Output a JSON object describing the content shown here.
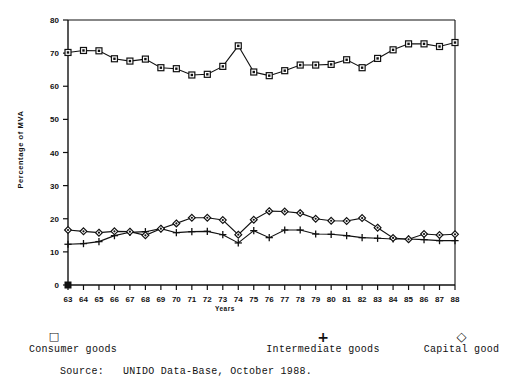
{
  "chart_data": {
    "type": "line",
    "title": "",
    "xlabel": "Years",
    "ylabel": "Percentage of MVA",
    "ylim": [
      0,
      80
    ],
    "yticks": [
      0,
      10,
      20,
      30,
      40,
      50,
      60,
      70,
      80
    ],
    "grid": false,
    "legend_position": "below-plot",
    "categories": [
      "63",
      "64",
      "65",
      "66",
      "67",
      "68",
      "69",
      "70",
      "71",
      "72",
      "73",
      "74",
      "75",
      "76",
      "77",
      "78",
      "79",
      "80",
      "81",
      "82",
      "83",
      "84",
      "85",
      "86",
      "87",
      "88"
    ],
    "series": [
      {
        "name": "Consumer goods",
        "marker": "square",
        "values": [
          70.2,
          70.8,
          70.7,
          68.3,
          67.6,
          68.2,
          65.6,
          65.3,
          63.4,
          63.6,
          66.0,
          72.2,
          64.3,
          63.2,
          64.7,
          66.4,
          66.4,
          66.6,
          68.0,
          65.6,
          68.4,
          71.0,
          72.8,
          72.8,
          72.0,
          73.2
        ]
      },
      {
        "name": "Intermediate goods",
        "marker": "plus",
        "values": [
          12.3,
          12.5,
          13.1,
          14.9,
          15.9,
          16.1,
          17.0,
          15.8,
          16.1,
          16.2,
          15.2,
          12.7,
          16.4,
          14.3,
          16.6,
          16.6,
          15.4,
          15.3,
          14.9,
          14.3,
          14.1,
          13.9,
          13.9,
          13.7,
          13.4,
          13.4
        ]
      },
      {
        "name": "Capital good",
        "marker": "diamond",
        "values": [
          16.6,
          16.2,
          15.8,
          16.2,
          16.1,
          15.0,
          17.0,
          18.6,
          20.3,
          20.3,
          19.6,
          15.2,
          19.7,
          22.3,
          22.2,
          21.7,
          20.0,
          19.4,
          19.3,
          20.2,
          17.3,
          14.2,
          13.8,
          15.4,
          15.1,
          15.3
        ]
      }
    ]
  },
  "axes": {
    "ylabel_text": "Percentage of MVA",
    "xlabel_text": "Years"
  },
  "legend": {
    "items": [
      {
        "marker_glyph": "□",
        "label": "Consumer goods"
      },
      {
        "marker_glyph": "+",
        "label": "Intermediate goods"
      },
      {
        "marker_glyph": "◇",
        "label": "Capital good"
      }
    ]
  },
  "footer": {
    "source_text": "Source:   UNIDO Data-Base, October 1988."
  },
  "colors": {
    "ink": "#111111",
    "background": "#ffffff"
  }
}
